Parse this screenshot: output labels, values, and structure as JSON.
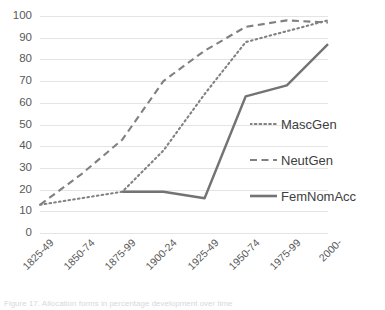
{
  "chart_data": {
    "type": "line",
    "title": "",
    "xlabel": "",
    "ylabel": "",
    "ylim": [
      0,
      100
    ],
    "ytick_step": 10,
    "grid": true,
    "legend_position": "right",
    "categories": [
      "1825-49",
      "1850-74",
      "1875-99",
      "1900-24",
      "1925-49",
      "1950-74",
      "1975-99",
      "2000-"
    ],
    "yticks": [
      "100",
      "90",
      "80",
      "70",
      "60",
      "50",
      "40",
      "30",
      "20",
      "10",
      "0"
    ],
    "series": [
      {
        "name": "MascGen",
        "style": "dotted",
        "color": "#808080",
        "x": [
          "1825-49",
          "1850-74",
          "1875-99",
          "1900-24",
          "1925-49",
          "1950-74",
          "1975-99",
          "2000-"
        ],
        "values": [
          13,
          16,
          19,
          38,
          64,
          88,
          93,
          98
        ]
      },
      {
        "name": "NeutGen",
        "style": "dashed",
        "color": "#808080",
        "x": [
          "1825-49",
          "1850-74",
          "1875-99",
          "1900-24",
          "1925-49",
          "1950-74",
          "1975-99",
          "2000-"
        ],
        "values": [
          13,
          27,
          43,
          70,
          84,
          95,
          98,
          97
        ]
      },
      {
        "name": "FemNomAcc",
        "style": "solid",
        "color": "#737373",
        "x": [
          "1875-99",
          "1900-24",
          "1925-49",
          "1950-74",
          "1975-99",
          "2000-"
        ],
        "values": [
          19,
          19,
          16,
          63,
          68,
          87
        ]
      }
    ]
  },
  "legend": {
    "items": [
      {
        "label": "MascGen",
        "marker": "dotted-line-icon"
      },
      {
        "label": "NeutGen",
        "marker": "dashed-line-icon"
      },
      {
        "label": "FemNomAcc",
        "marker": "solid-line-icon"
      }
    ]
  },
  "caption": {
    "text": "Figure 17. Allocation forms in percentage development over time"
  },
  "colors": {
    "grid": "#e4e4e4",
    "text": "#595959",
    "series": "#808080"
  }
}
